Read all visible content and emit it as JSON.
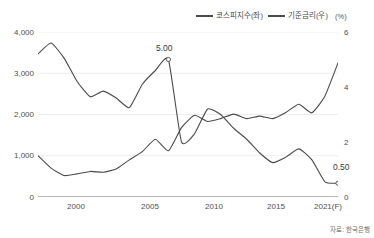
{
  "legend": {
    "items": [
      {
        "label": "코스피지수(좌)",
        "color": "#4a4a4a"
      },
      {
        "label": "기준금리(우)",
        "color": "#4a4a4a"
      }
    ],
    "unit": "(%)"
  },
  "axes": {
    "left_ticks": [
      "4,000",
      "3,000",
      "2,000",
      "1,000",
      "0"
    ],
    "right_ticks": [
      "6",
      "4",
      "2",
      "0"
    ],
    "x_ticks": [
      "2000",
      "2005",
      "2010",
      "2015",
      "2021(F)"
    ]
  },
  "annotations": [
    {
      "name": "rate-peak-label",
      "text": "5.00"
    },
    {
      "name": "rate-final-label",
      "text": "0.50"
    }
  ],
  "source": "자료: 한국은행",
  "chart_data": {
    "type": "line",
    "title": "",
    "xlabel": "",
    "ylabel": "",
    "grid": true,
    "legend_position": "top-right",
    "x": [
      1998,
      1999,
      2000,
      2001,
      2002,
      2003,
      2004,
      2005,
      2006,
      2007,
      2008,
      2009,
      2010,
      2011,
      2012,
      2013,
      2014,
      2015,
      2016,
      2017,
      2018,
      2019,
      2020,
      2021
    ],
    "axis_left": {
      "label": "코스피지수",
      "ylim": [
        0,
        4000
      ],
      "ticks": [
        0,
        1000,
        2000,
        3000,
        4000
      ]
    },
    "axis_right": {
      "label": "기준금리 (%)",
      "ylim": [
        0,
        6
      ],
      "ticks": [
        0,
        2,
        4,
        6
      ]
    },
    "series": [
      {
        "name": "코스피지수(좌)",
        "axis": "left",
        "color": "#4a4a4a",
        "values": [
          1000,
          700,
          520,
          560,
          620,
          600,
          680,
          900,
          1100,
          1400,
          1120,
          1680,
          1980,
          1830,
          1900,
          2010,
          1900,
          1960,
          1900,
          2050,
          2250,
          2040,
          2450,
          3250
        ]
      },
      {
        "name": "기준금리(우)",
        "axis": "right",
        "color": "#4a4a4a",
        "values": [
          5.2,
          5.6,
          5.05,
          4.2,
          3.65,
          3.85,
          3.6,
          3.25,
          4.1,
          4.6,
          5.0,
          2.0,
          2.3,
          3.2,
          3.0,
          2.5,
          2.1,
          1.6,
          1.25,
          1.45,
          1.75,
          1.35,
          0.55,
          0.5
        ]
      }
    ],
    "data_labels": [
      {
        "series": "기준금리(우)",
        "x": 2008,
        "value": 5.0,
        "text": "5.00",
        "marker": "circle"
      },
      {
        "series": "기준금리(우)",
        "x": 2021,
        "value": 0.5,
        "text": "0.50",
        "marker": "circle"
      }
    ]
  }
}
